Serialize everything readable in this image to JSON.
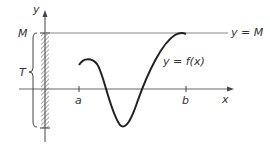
{
  "diagram": {
    "axes": {
      "x_label": "x",
      "y_label": "y"
    },
    "ticks": {
      "a": "a",
      "b": "b"
    },
    "labels": {
      "upper_bound_line": "y = M",
      "function": "y = f(x)",
      "M": "M",
      "T": "T"
    },
    "colors": {
      "line": "#222222",
      "axis": "#444444",
      "hatch": "#555555"
    }
  }
}
